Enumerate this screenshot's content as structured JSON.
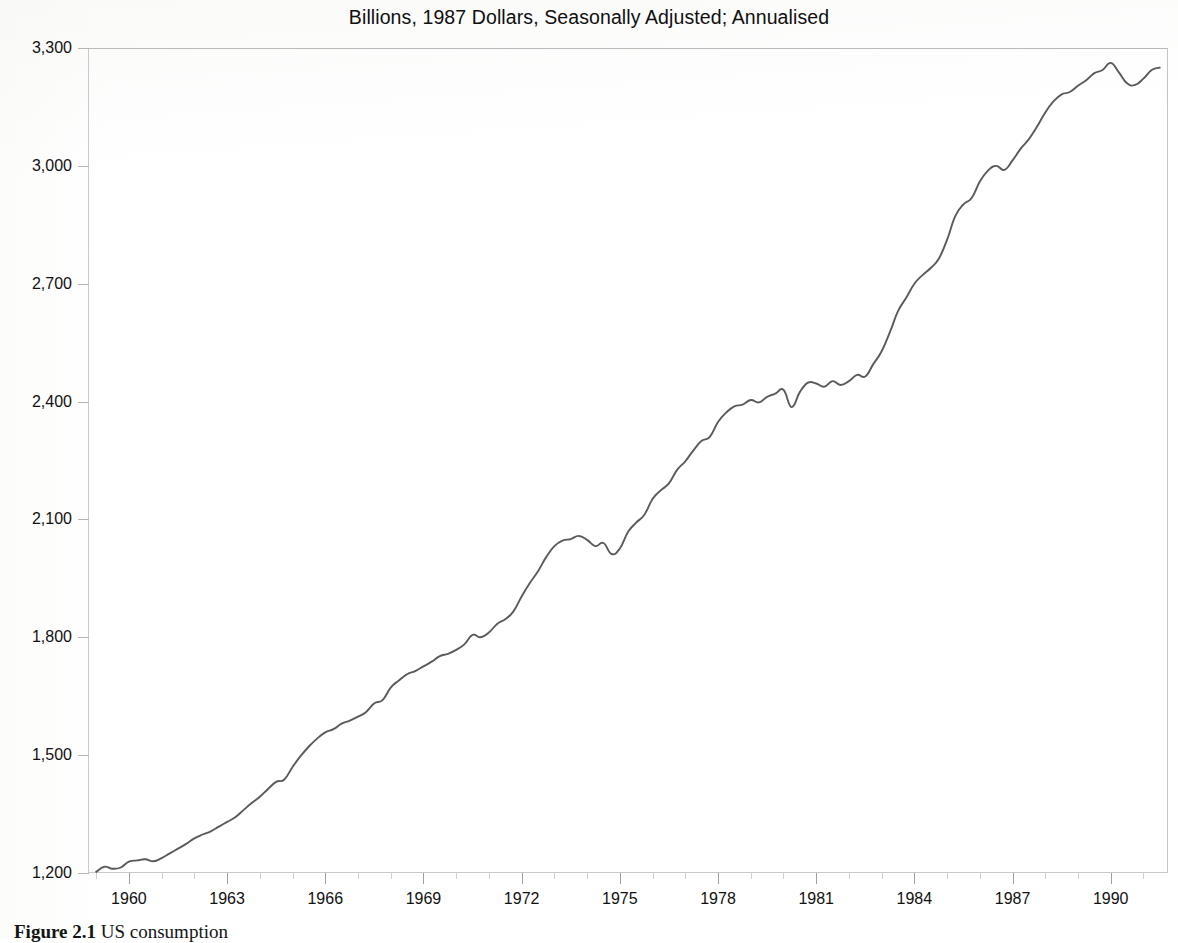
{
  "chart_title": "Billions, 1987 Dollars, Seasonally Adjusted; Annualised",
  "figure": {
    "number": "Figure 2.1",
    "caption": "US consumption"
  },
  "axes": {
    "y_ticks": [
      "1,200",
      "1,500",
      "1,800",
      "2,100",
      "2,400",
      "2,700",
      "3,000",
      "3,300"
    ],
    "y_tick_values": [
      1200,
      1500,
      1800,
      2100,
      2400,
      2700,
      3000,
      3300
    ],
    "x_ticks": [
      "1960",
      "1963",
      "1966",
      "1969",
      "1972",
      "1975",
      "1978",
      "1981",
      "1984",
      "1987",
      "1990"
    ],
    "x_tick_values": [
      1960,
      1963,
      1966,
      1969,
      1972,
      1975,
      1978,
      1981,
      1984,
      1987,
      1990
    ],
    "x_minor_step": 1,
    "ylim": [
      1200,
      3300
    ],
    "xlim": [
      1958.75,
      1991.75
    ],
    "grid": false,
    "line_color": "#5a5a5a",
    "axis_color": "#c9c9c9"
  },
  "chart_data": {
    "type": "line",
    "title": "Billions, 1987 Dollars, Seasonally Adjusted; Annualised",
    "xlabel": "",
    "ylabel": "",
    "ylim": [
      1200,
      3300
    ],
    "xlim": [
      1958.75,
      1991.75
    ],
    "grid": false,
    "legend": null,
    "series": [
      {
        "name": "US consumption",
        "color": "#5a5a5a",
        "x": [
          1959.0,
          1959.25,
          1959.5,
          1959.75,
          1960.0,
          1960.25,
          1960.5,
          1960.75,
          1961.0,
          1961.25,
          1961.5,
          1961.75,
          1962.0,
          1962.25,
          1962.5,
          1962.75,
          1963.0,
          1963.25,
          1963.5,
          1963.75,
          1964.0,
          1964.25,
          1964.5,
          1964.75,
          1965.0,
          1965.25,
          1965.5,
          1965.75,
          1966.0,
          1966.25,
          1966.5,
          1966.75,
          1967.0,
          1967.25,
          1967.5,
          1967.75,
          1968.0,
          1968.25,
          1968.5,
          1968.75,
          1969.0,
          1969.25,
          1969.5,
          1969.75,
          1970.0,
          1970.25,
          1970.5,
          1970.75,
          1971.0,
          1971.25,
          1971.5,
          1971.75,
          1972.0,
          1972.25,
          1972.5,
          1972.75,
          1973.0,
          1973.25,
          1973.5,
          1973.75,
          1974.0,
          1974.25,
          1974.5,
          1974.75,
          1975.0,
          1975.25,
          1975.5,
          1975.75,
          1976.0,
          1976.25,
          1976.5,
          1976.75,
          1977.0,
          1977.25,
          1977.5,
          1977.75,
          1978.0,
          1978.25,
          1978.5,
          1978.75,
          1979.0,
          1979.25,
          1979.5,
          1979.75,
          1980.0,
          1980.25,
          1980.5,
          1980.75,
          1981.0,
          1981.25,
          1981.5,
          1981.75,
          1982.0,
          1982.25,
          1982.5,
          1982.75,
          1983.0,
          1983.25,
          1983.5,
          1983.75,
          1984.0,
          1984.25,
          1984.5,
          1984.75,
          1985.0,
          1985.25,
          1985.5,
          1985.75,
          1986.0,
          1986.25,
          1986.5,
          1986.75,
          1987.0,
          1987.25,
          1987.5,
          1987.75,
          1988.0,
          1988.25,
          1988.5,
          1988.75,
          1989.0,
          1989.25,
          1989.5,
          1989.75,
          1990.0,
          1990.25,
          1990.5,
          1990.75,
          1991.0,
          1991.25,
          1991.5
        ],
        "y": [
          1203,
          1216,
          1211,
          1214,
          1229,
          1232,
          1235,
          1230,
          1238,
          1250,
          1262,
          1274,
          1288,
          1298,
          1306,
          1318,
          1330,
          1342,
          1360,
          1378,
          1394,
          1414,
          1432,
          1438,
          1470,
          1498,
          1522,
          1542,
          1558,
          1566,
          1580,
          1588,
          1598,
          1610,
          1632,
          1640,
          1672,
          1690,
          1706,
          1714,
          1726,
          1738,
          1752,
          1758,
          1768,
          1782,
          1806,
          1800,
          1812,
          1834,
          1846,
          1866,
          1904,
          1938,
          1968,
          2004,
          2032,
          2046,
          2050,
          2058,
          2048,
          2032,
          2040,
          2012,
          2026,
          2068,
          2092,
          2112,
          2152,
          2174,
          2192,
          2226,
          2248,
          2276,
          2300,
          2310,
          2348,
          2372,
          2388,
          2392,
          2404,
          2398,
          2412,
          2420,
          2430,
          2386,
          2424,
          2448,
          2446,
          2438,
          2452,
          2442,
          2452,
          2468,
          2464,
          2496,
          2528,
          2576,
          2630,
          2664,
          2700,
          2722,
          2740,
          2764,
          2812,
          2872,
          2902,
          2918,
          2960,
          2988,
          3000,
          2990,
          3014,
          3044,
          3068,
          3100,
          3136,
          3164,
          3182,
          3188,
          3204,
          3218,
          3236,
          3244,
          3262,
          3238,
          3210,
          3206,
          3222,
          3244,
          3250
        ]
      }
    ]
  }
}
